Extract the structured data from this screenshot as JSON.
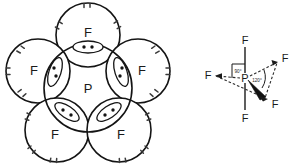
{
  "figure": {
    "background_color": "#ffffff",
    "ink_color": "#141414"
  },
  "lewis_structure": {
    "name": "lewis-dot-structure",
    "central_atom": "P",
    "ligand_label": "F",
    "ligand_count": 5,
    "bonding_pair_dots": 2,
    "lone_pair_marks_per_ligand": 6,
    "ligands": [
      {
        "label": "F",
        "position": "top"
      },
      {
        "label": "F",
        "position": "left"
      },
      {
        "label": "F",
        "position": "right"
      },
      {
        "label": "F",
        "position": "bottom-left"
      },
      {
        "label": "F",
        "position": "bottom-right"
      }
    ]
  },
  "geometry_structure": {
    "name": "trigonal-bipyramidal-geometry",
    "central_atom": "P",
    "shape": "trigonal bipyramidal",
    "angles": [
      {
        "value": "90°",
        "between": "axial-equatorial"
      },
      {
        "value": "120°",
        "between": "equatorial-equatorial"
      }
    ],
    "bonds": [
      {
        "label": "F",
        "position": "axial-top",
        "style": "solid"
      },
      {
        "label": "F",
        "position": "axial-bottom",
        "style": "solid"
      },
      {
        "label": "F",
        "position": "equatorial-left",
        "style": "dashed"
      },
      {
        "label": "F",
        "position": "equatorial-upper-right",
        "style": "dashed"
      },
      {
        "label": "F",
        "position": "equatorial-lower-right",
        "style": "wedge"
      }
    ]
  }
}
